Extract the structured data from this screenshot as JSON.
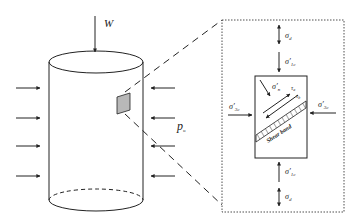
{
  "diagram": {
    "cylinder": {
      "load_label": "W",
      "pressure_label": "p",
      "pressure_sub": "o",
      "arrows_left": 4,
      "arrows_right": 4
    },
    "element": {
      "top_outer_label": "σ",
      "top_outer_sub": "d",
      "top_inner_label": "σ′",
      "top_inner_sub": "1c",
      "left_label": "σ′",
      "left_sub": "3c",
      "right_label": "σ′",
      "right_sub": "3c",
      "bottom_inner_label": "σ′",
      "bottom_inner_sub": "1c",
      "bottom_outer_label": "σ",
      "bottom_outer_sub": "d",
      "normal_stress_label": "σ′",
      "normal_stress_sub": "n",
      "shear_a_label": "τ",
      "shear_a_sub": "a",
      "shear_b_label": "τ",
      "shear_b_sub": "b",
      "band_label": "Shear band"
    },
    "colors": {
      "line": "#222222",
      "patch": "#b8b8b8",
      "background": "#ffffff"
    }
  }
}
